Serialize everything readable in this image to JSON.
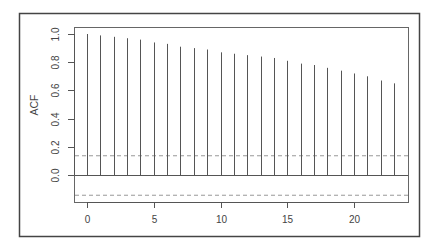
{
  "chart_data": {
    "type": "bar",
    "subtype": "acf-correlogram",
    "title": "",
    "xlabel": "",
    "ylabel": "ACF",
    "x": [
      0,
      1,
      2,
      3,
      4,
      5,
      6,
      7,
      8,
      9,
      10,
      11,
      12,
      13,
      14,
      15,
      16,
      17,
      18,
      19,
      20,
      21,
      22,
      23
    ],
    "values": [
      1.0,
      0.99,
      0.98,
      0.97,
      0.96,
      0.94,
      0.93,
      0.91,
      0.9,
      0.89,
      0.87,
      0.86,
      0.85,
      0.84,
      0.83,
      0.81,
      0.79,
      0.78,
      0.76,
      0.74,
      0.72,
      0.7,
      0.67,
      0.65
    ],
    "confidence_bounds": [
      0.14,
      -0.14
    ],
    "xticks": [
      0,
      5,
      10,
      15,
      20
    ],
    "xtick_labels": [
      "0",
      "5",
      "10",
      "15",
      "20"
    ],
    "yticks": [
      0.0,
      0.2,
      0.4,
      0.6,
      0.8,
      1.0
    ],
    "ytick_labels": [
      "0.0",
      "0.2",
      "0.4",
      "0.6",
      "0.8",
      "1.0"
    ],
    "xlim": [
      -0.9,
      24.1
    ],
    "ylim": [
      -0.19,
      1.05
    ],
    "grid": false,
    "legend": null,
    "colors": {
      "frame": "#444444",
      "spike": "#555555",
      "zero_line": "#555555",
      "bound_line": "#999999",
      "text": "#444444"
    }
  }
}
